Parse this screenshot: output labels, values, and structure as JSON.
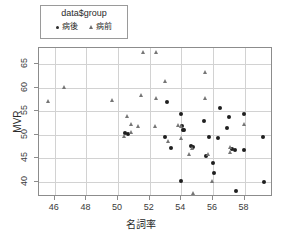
{
  "legend": {
    "title": "data$group",
    "entries": [
      {
        "label": "病後",
        "marker": "circle-marker",
        "color": "#1f1f1f"
      },
      {
        "label": "病前",
        "marker": "triangle-marker",
        "color": "#767676"
      }
    ]
  },
  "chart_data": {
    "type": "scatter",
    "title": "",
    "xlabel": "名詞率",
    "ylabel": "MVR",
    "xlim": [
      45.0,
      59.8
    ],
    "ylim": [
      36.8,
      68.4
    ],
    "xticks": [
      46,
      48,
      50,
      52,
      54,
      56,
      58
    ],
    "yticks": [
      40,
      45,
      50,
      55,
      60,
      65
    ],
    "xticklabels": [
      "46",
      "48",
      "50",
      "52",
      "54",
      "56",
      "58"
    ],
    "yticklabels": [
      "40",
      "45",
      "50",
      "55",
      "60",
      "65"
    ],
    "grid": true,
    "legend_position": "top-left",
    "series": [
      {
        "name": "病後",
        "marker": "circle",
        "color": "#1f1f1f",
        "points": [
          [
            50.45,
            50.3
          ],
          [
            50.6,
            50.1
          ],
          [
            52.95,
            49.6
          ],
          [
            53.1,
            56.9
          ],
          [
            53.35,
            47.2
          ],
          [
            53.95,
            54.5
          ],
          [
            54.0,
            40.1
          ],
          [
            54.05,
            51.8
          ],
          [
            54.1,
            51.0
          ],
          [
            54.2,
            51.1
          ],
          [
            54.6,
            47.6
          ],
          [
            54.75,
            47.4
          ],
          [
            55.45,
            52.9
          ],
          [
            55.55,
            45.4
          ],
          [
            55.75,
            49.6
          ],
          [
            56.0,
            44.0
          ],
          [
            56.05,
            41.9
          ],
          [
            56.3,
            49.4
          ],
          [
            56.45,
            55.6
          ],
          [
            56.9,
            51.5
          ],
          [
            57.0,
            53.8
          ],
          [
            57.2,
            46.9
          ],
          [
            57.4,
            46.8
          ],
          [
            57.45,
            38.1
          ],
          [
            57.95,
            54.3
          ],
          [
            57.95,
            46.8
          ],
          [
            59.15,
            49.5
          ],
          [
            59.2,
            39.9
          ]
        ]
      },
      {
        "name": "病前",
        "marker": "triangle",
        "color": "#767676",
        "points": [
          [
            45.6,
            57.2
          ],
          [
            46.55,
            60.2
          ],
          [
            49.6,
            57.4
          ],
          [
            50.4,
            49.7
          ],
          [
            50.55,
            53.9
          ],
          [
            50.8,
            52.3
          ],
          [
            50.85,
            50.6
          ],
          [
            51.25,
            51.8
          ],
          [
            51.45,
            58.4
          ],
          [
            51.6,
            67.5
          ],
          [
            52.35,
            51.9
          ],
          [
            52.4,
            67.5
          ],
          [
            52.4,
            57.9
          ],
          [
            53.0,
            61.4
          ],
          [
            53.15,
            48.6
          ],
          [
            53.8,
            52.0
          ],
          [
            53.95,
            51.9
          ],
          [
            54.0,
            49.3
          ],
          [
            54.5,
            46.0
          ],
          [
            54.7,
            47.2
          ],
          [
            54.75,
            37.7
          ],
          [
            55.5,
            57.9
          ],
          [
            55.7,
            46.0
          ],
          [
            55.95,
            40.1
          ],
          [
            55.5,
            63.4
          ],
          [
            57.05,
            47.5
          ],
          [
            57.05,
            46.3
          ],
          [
            57.95,
            52.2
          ]
        ]
      }
    ]
  }
}
